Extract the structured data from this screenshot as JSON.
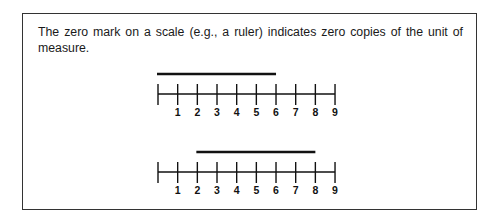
{
  "caption": "The zero mark on a scale (e.g., a ruler) indicates zero copies of the unit of measure.",
  "rulers": [
    {
      "name": "ruler-top",
      "tick_labels": [
        "",
        "1",
        "2",
        "3",
        "4",
        "5",
        "6",
        "7",
        "8",
        "9"
      ],
      "bar": {
        "start": 0,
        "end": 6
      }
    },
    {
      "name": "ruler-bottom",
      "tick_labels": [
        "",
        "1",
        "2",
        "3",
        "4",
        "5",
        "6",
        "7",
        "8",
        "9"
      ],
      "bar": {
        "start": 2,
        "end": 8
      }
    }
  ],
  "colors": {
    "line": "#111111",
    "frame": "#333333"
  }
}
